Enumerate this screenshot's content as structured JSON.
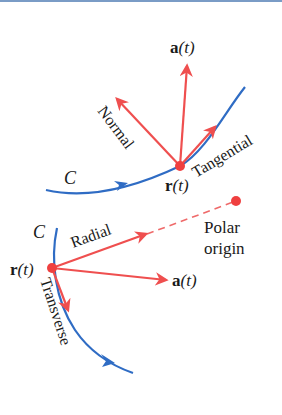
{
  "colors": {
    "curve": "#2f6cc4",
    "vector": "#ef4f4f",
    "point": "#ef4040",
    "text": "#1a1a1a",
    "top_rule": "#7a9cc6"
  },
  "upper_diagram": {
    "curve_label": "C",
    "point_label_bold": "r",
    "point_label_arg": "(t)",
    "vectors": {
      "acceleration_bold": "a",
      "acceleration_arg": "(t)",
      "normal": "Normal",
      "tangential": "Tangential"
    }
  },
  "lower_diagram": {
    "curve_label": "C",
    "point_label_bold": "r",
    "point_label_arg": "(t)",
    "vectors": {
      "radial": "Radial",
      "transverse": "Transverse",
      "acceleration_bold": "a",
      "acceleration_arg": "(t)"
    },
    "origin_label_line1": "Polar",
    "origin_label_line2": "origin"
  }
}
